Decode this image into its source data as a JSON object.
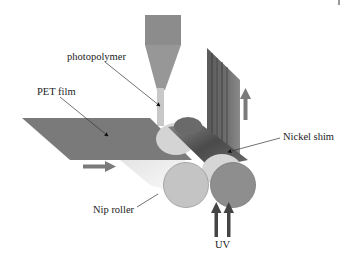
{
  "diagram": {
    "type": "process-schematic",
    "labels": {
      "photopolymer": "photopolymer",
      "pet_film": "PET film",
      "nip_roller": "Nip roller",
      "nickel_shim": "Nickel shim",
      "uv": "UV"
    },
    "colors": {
      "film": "#7a7a7a",
      "hopper": "#8c8c8c",
      "nozzle": "#c8c8c8",
      "nip_roller": "#c4c4c4",
      "imprint_roller": "#8e8e8e",
      "back_roller_dark": "#555555",
      "back_roller_light": "#d6d6d6",
      "shim": "#6a6a6a",
      "arrow": "#707070",
      "uv_arrow": "#444444",
      "leader": "#333333"
    },
    "corner_mark": "|"
  }
}
